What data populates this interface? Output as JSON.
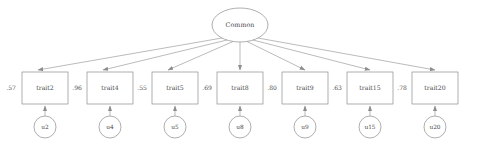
{
  "diagram": {
    "type": "path-diagram",
    "latent": {
      "id": "common",
      "label": "Common",
      "shape": "ellipse",
      "cx": 240,
      "cy": 25,
      "rx": 28,
      "ry": 17
    },
    "indicators": [
      {
        "id": "trait2",
        "label": "trait2",
        "loading": ".57",
        "x": 22,
        "y": 72,
        "w": 46,
        "h": 32,
        "arrow_x": 38
      },
      {
        "id": "trait4",
        "label": "trait4",
        "loading": ".96",
        "x": 87,
        "y": 72,
        "w": 46,
        "h": 32,
        "arrow_x": 103
      },
      {
        "id": "trait5",
        "label": "trait5",
        "loading": ".55",
        "x": 152,
        "y": 72,
        "w": 46,
        "h": 32,
        "arrow_x": 168
      },
      {
        "id": "trait8",
        "label": "trait8",
        "loading": ".69",
        "x": 217,
        "y": 72,
        "w": 46,
        "h": 32,
        "arrow_x": 240
      },
      {
        "id": "trait9",
        "label": "trait9",
        "loading": ".80",
        "x": 282,
        "y": 72,
        "w": 46,
        "h": 32,
        "arrow_x": 305
      },
      {
        "id": "trait15",
        "label": "trait15",
        "loading": ".63",
        "x": 347,
        "y": 72,
        "w": 46,
        "h": 32,
        "arrow_x": 370
      },
      {
        "id": "trait20",
        "label": "trait20",
        "loading": ".78",
        "x": 412,
        "y": 72,
        "w": 46,
        "h": 32,
        "arrow_x": 435
      }
    ],
    "residuals": [
      {
        "id": "u2",
        "label": "u2",
        "cx": 45,
        "cy": 127,
        "r": 11
      },
      {
        "id": "u4",
        "label": "u4",
        "cx": 110,
        "cy": 127,
        "r": 11
      },
      {
        "id": "u5",
        "label": "u5",
        "cx": 175,
        "cy": 127,
        "r": 11
      },
      {
        "id": "u8",
        "label": "u8",
        "cx": 240,
        "cy": 127,
        "r": 11
      },
      {
        "id": "u9",
        "label": "u9",
        "cx": 305,
        "cy": 127,
        "r": 11
      },
      {
        "id": "u15",
        "label": "u15",
        "cx": 370,
        "cy": 127,
        "r": 11
      },
      {
        "id": "u20",
        "label": "u20",
        "cx": 435,
        "cy": 127,
        "r": 11
      }
    ],
    "coefficient_positions": [
      {
        "id": "coef-trait2",
        "x": 11,
        "y": 88
      },
      {
        "id": "coef-trait4",
        "x": 77,
        "y": 88
      },
      {
        "id": "coef-trait5",
        "x": 142,
        "y": 88
      },
      {
        "id": "coef-trait8",
        "x": 207,
        "y": 88
      },
      {
        "id": "coef-trait9",
        "x": 272,
        "y": 88
      },
      {
        "id": "coef-trait15",
        "x": 337,
        "y": 88
      },
      {
        "id": "coef-trait20",
        "x": 402,
        "y": 88
      }
    ],
    "colors": {
      "stroke": "#8d8d8d",
      "text": "#4a4a4a",
      "background": "#ffffff"
    }
  }
}
